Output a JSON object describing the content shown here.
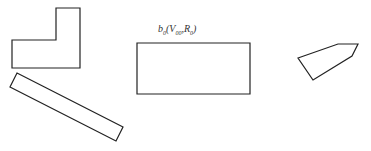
{
  "diagram": {
    "stroke_color": "#222222",
    "background": "#ffffff",
    "shapes": [
      {
        "name": "l-shape",
        "type": "polygon",
        "points": "12,40 56,40 56,8 80,8 80,68 12,68"
      },
      {
        "name": "tilted-bar",
        "type": "polygon",
        "points": "17,73 123,127 116,141 10,87"
      },
      {
        "name": "target-rectangle",
        "type": "polygon",
        "points": "137,43 250,43 250,94 137,94"
      },
      {
        "name": "pentagon-tag",
        "type": "polygon",
        "points": "298,58 338,44 358,44 352,56 313,80"
      }
    ],
    "label": {
      "base": "b",
      "sub0": "0",
      "open": "(",
      "var1": "V",
      "sub1": "00",
      "sep": ",",
      "var2": "R",
      "sub2": "0",
      "close": ")"
    }
  }
}
